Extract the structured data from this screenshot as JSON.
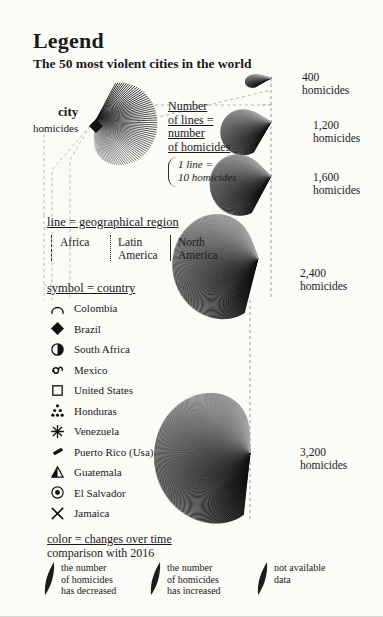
{
  "header": {
    "title": "Legend",
    "subtitle": "The 50 most violent cities in the world"
  },
  "city_marker": {
    "city_label": "city",
    "homicides_label": "homicides",
    "symbol": "diamond-marker"
  },
  "lines_explainer": {
    "line1": "Number",
    "line2": "of lines =",
    "line3": "number",
    "line4": "of homicides",
    "ratio": "1 line =\n10 homicides"
  },
  "regions": {
    "heading": "line = geographical region",
    "items": [
      {
        "label": "Africa",
        "line_style": "dashed"
      },
      {
        "label": "Latin\nAmerica",
        "line_style": "dotted"
      },
      {
        "label": "North\nAmerica",
        "line_style": "solid"
      }
    ]
  },
  "countries": {
    "heading": "symbol = country",
    "items": [
      {
        "name": "Colombia",
        "icon": "arch-icon"
      },
      {
        "name": "Brazil",
        "icon": "diamond-icon"
      },
      {
        "name": "South Africa",
        "icon": "half-filled-circle-icon"
      },
      {
        "name": "Mexico",
        "icon": "swirl-icon"
      },
      {
        "name": "United States",
        "icon": "square-outline-icon"
      },
      {
        "name": "Honduras",
        "icon": "dot-cluster-icon"
      },
      {
        "name": "Venezuela",
        "icon": "star-burst-icon"
      },
      {
        "name": "Puerto Rico (Usa)",
        "icon": "rhombus-filled-icon"
      },
      {
        "name": "Guatemala",
        "icon": "triangle-split-icon"
      },
      {
        "name": "El Salvador",
        "icon": "concentric-circle-icon"
      },
      {
        "name": "Jamaica",
        "icon": "cross-x-icon"
      }
    ]
  },
  "color_legend": {
    "heading": "color = changes over time",
    "subheading": "comparison with 2016",
    "items": [
      {
        "text": "the number\nof homicides\nhas decreased",
        "swatch": "crescent-dark"
      },
      {
        "text": "the number\nof homicides\nhas increased",
        "swatch": "crescent-dark"
      },
      {
        "text": "not available\ndata",
        "swatch": "crescent-dark"
      }
    ]
  },
  "chart_data": {
    "type": "scatter",
    "title": "The 50 most violent cities in the world",
    "xlabel": "",
    "ylabel": "homicides",
    "encoding": {
      "lines_per_shell": "1 line = 10 homicides",
      "line_style": "geographical region",
      "symbol": "country",
      "color": "changes over time vs 2016"
    },
    "scale_markers": [
      {
        "value": 400,
        "label": "400\nhomicides",
        "lines": 40
      },
      {
        "value": 1200,
        "label": "1,200\nhomicides",
        "lines": 120
      },
      {
        "value": 1600,
        "label": "1,600\nhomicides",
        "lines": 160
      },
      {
        "value": 2400,
        "label": "2,400\nhomicides",
        "lines": 240
      },
      {
        "value": 3200,
        "label": "3,200\nhomicides",
        "lines": 320
      }
    ]
  }
}
